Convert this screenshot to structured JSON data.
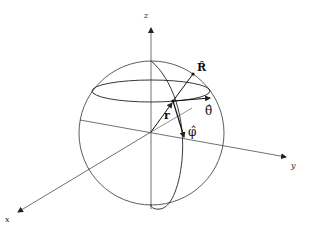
{
  "diagram": {
    "type": "spherical-coordinate-unit-vectors",
    "axes": {
      "x_label": "x",
      "y_label": "y",
      "z_label": "z"
    },
    "vectors": {
      "position_label": "r",
      "R_hat_label": "R̂",
      "theta_hat_label": "θ̂",
      "phi_hat_label": "φ̂"
    },
    "colors": {
      "stroke": "#222222",
      "background": "#ffffff"
    }
  }
}
